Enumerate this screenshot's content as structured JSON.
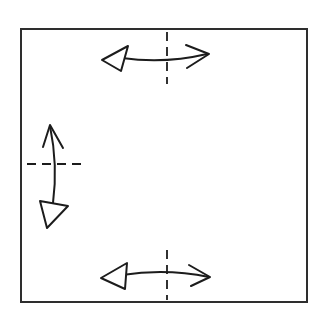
{
  "diagram": {
    "colors": {
      "line": "#1c1c1c",
      "frame": "#2e2e2e",
      "background": "#ffffff"
    },
    "frame": {
      "x": 21,
      "y": 29,
      "width": 286,
      "height": 273
    },
    "arrows": [
      {
        "id": "top",
        "orientation": "horizontal",
        "axis": "dashed-vertical",
        "closed_head": "left",
        "open_head": "right"
      },
      {
        "id": "left",
        "orientation": "vertical",
        "axis": "dashed-horizontal",
        "closed_head": "bottom",
        "open_head": "top"
      },
      {
        "id": "bottom",
        "orientation": "horizontal",
        "axis": "dashed-vertical",
        "closed_head": "left",
        "open_head": "right"
      }
    ]
  }
}
